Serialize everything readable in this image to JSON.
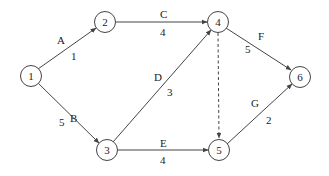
{
  "diagram": {
    "type": "activity-on-arrow network",
    "colors": {
      "stroke": "#444444",
      "text": "#222222",
      "background": "#ffffff"
    },
    "nodes": [
      {
        "id": "1",
        "label": "1",
        "x": 31,
        "y": 76
      },
      {
        "id": "2",
        "label": "2",
        "x": 105,
        "y": 22
      },
      {
        "id": "3",
        "label": "3",
        "x": 107,
        "y": 150
      },
      {
        "id": "4",
        "label": "4",
        "x": 218,
        "y": 22
      },
      {
        "id": "5",
        "label": "5",
        "x": 219,
        "y": 150
      },
      {
        "id": "6",
        "label": "6",
        "x": 300,
        "y": 77
      }
    ],
    "edges": [
      {
        "from": "1",
        "to": "2",
        "activity": "A",
        "duration": "1",
        "dashed": false
      },
      {
        "from": "1",
        "to": "3",
        "activity": "B",
        "duration": "5",
        "dashed": false
      },
      {
        "from": "2",
        "to": "4",
        "activity": "C",
        "duration": "4",
        "dashed": false
      },
      {
        "from": "3",
        "to": "4",
        "activity": "D",
        "duration": "3",
        "dashed": false
      },
      {
        "from": "3",
        "to": "5",
        "activity": "E",
        "duration": "4",
        "dashed": false
      },
      {
        "from": "4",
        "to": "6",
        "activity": "F",
        "duration": "5",
        "dashed": false
      },
      {
        "from": "5",
        "to": "6",
        "activity": "G",
        "duration": "2",
        "dashed": false
      },
      {
        "from": "4",
        "to": "5",
        "activity": "",
        "duration": "",
        "dashed": true,
        "note": "dummy activity"
      }
    ]
  }
}
